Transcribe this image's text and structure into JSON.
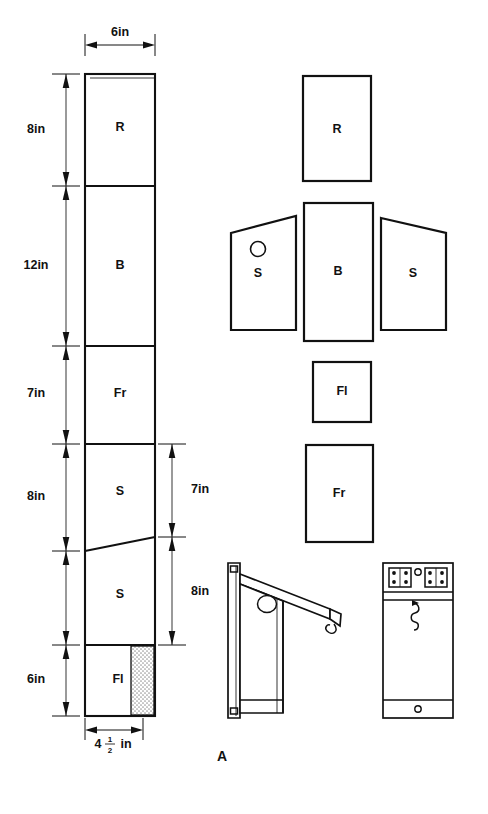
{
  "figure": {
    "label": "A",
    "title_visible": false
  },
  "cutting_layout": {
    "name": "board-cutting-layout",
    "board_width_label": "6in",
    "board_net_width_label_whole": "4",
    "board_net_width_numerator": "1",
    "board_net_width_denominator": "2",
    "board_net_width_unit": "in",
    "left_dimensions": [
      {
        "label": "8in",
        "piece": "R"
      },
      {
        "label": "12in",
        "piece": "B"
      },
      {
        "label": "7in",
        "piece": "Fr"
      },
      {
        "label": "8in",
        "piece": "S"
      },
      {
        "label": "6in",
        "piece": "Fl"
      }
    ],
    "right_dimensions": [
      {
        "label": "7in"
      },
      {
        "label": "8in"
      }
    ],
    "segments": [
      {
        "label": "R"
      },
      {
        "label": "B"
      },
      {
        "label": "Fr"
      },
      {
        "label": "S"
      },
      {
        "label": "S"
      },
      {
        "label": "Fl"
      }
    ],
    "waste_strip": {
      "name": "waste-strip",
      "hatch": "stipple"
    }
  },
  "parts": [
    {
      "name": "part-roof",
      "label": "R",
      "shape": "rectangle"
    },
    {
      "name": "part-side-left",
      "label": "S",
      "shape": "trapezoid",
      "has_hole": true
    },
    {
      "name": "part-back",
      "label": "B",
      "shape": "rectangle"
    },
    {
      "name": "part-side-right",
      "label": "S",
      "shape": "trapezoid",
      "has_hole": false
    },
    {
      "name": "part-floor",
      "label": "Fl",
      "shape": "rectangle"
    },
    {
      "name": "part-front",
      "label": "Fr",
      "shape": "rectangle"
    }
  ],
  "assembly_views": {
    "side_view": {
      "name": "assembled-side-view",
      "features": [
        "back-board",
        "sloped-roof",
        "entrance-hole",
        "hook"
      ]
    },
    "front_view": {
      "name": "assembled-front-view",
      "features": [
        "hinge-left",
        "hinge-right",
        "screw-hole",
        "hook",
        "bottom-screw"
      ]
    }
  },
  "colors": {
    "ink": "#111111",
    "paper": "#ffffff",
    "stipple": "#b8b8b8"
  }
}
